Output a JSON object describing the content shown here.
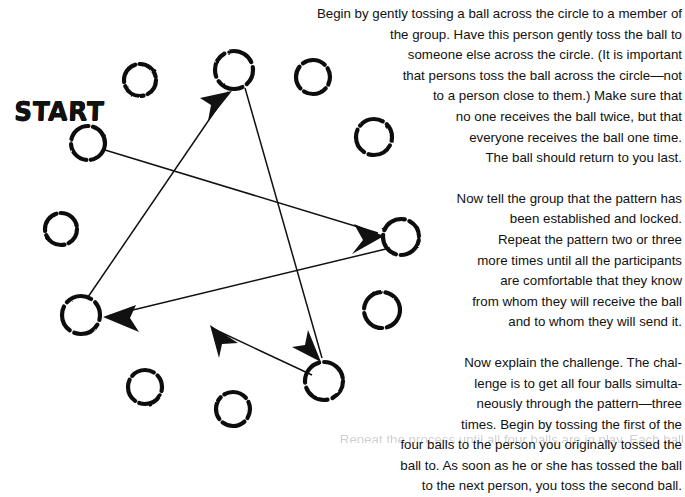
{
  "page": {
    "kind": "scanned-book-illustration",
    "background": "#ffffff",
    "ink_color": "#111111",
    "width": 685,
    "height": 444
  },
  "diagram": {
    "label": "START",
    "circle_count": 12,
    "circles": [
      {
        "id": "c-start",
        "name": "circle-start",
        "cx": 88,
        "cy": 143,
        "r": 17
      },
      {
        "id": "c-upper-left",
        "name": "circle-upper-left",
        "cx": 140,
        "cy": 80,
        "r": 16
      },
      {
        "id": "c-top",
        "name": "circle-top",
        "cx": 234,
        "cy": 70,
        "r": 19
      },
      {
        "id": "c-top-right",
        "name": "circle-top-right",
        "cx": 313,
        "cy": 77,
        "r": 17
      },
      {
        "id": "c-right-upper",
        "name": "circle-right-upper",
        "cx": 374,
        "cy": 137,
        "r": 18
      },
      {
        "id": "c-right-mid",
        "name": "circle-right-middle",
        "cx": 401,
        "cy": 237,
        "r": 18
      },
      {
        "id": "c-right-lower",
        "name": "circle-right-lower",
        "cx": 382,
        "cy": 310,
        "r": 18
      },
      {
        "id": "c-bottom-right",
        "name": "circle-bottom-right",
        "cx": 324,
        "cy": 381,
        "r": 19
      },
      {
        "id": "c-bottom-mid",
        "name": "circle-bottom-middle",
        "cx": 233,
        "cy": 409,
        "r": 17
      },
      {
        "id": "c-bottom-left",
        "name": "circle-bottom-left",
        "cx": 145,
        "cy": 387,
        "r": 17
      },
      {
        "id": "c-left-lower",
        "name": "circle-left-lower",
        "cx": 81,
        "cy": 315,
        "r": 19
      },
      {
        "id": "c-left-upper",
        "name": "circle-left-upper",
        "cx": 61,
        "cy": 229,
        "r": 16
      }
    ],
    "arrows": [
      {
        "name": "arrow-start-to-right-middle",
        "from": "c-start",
        "to": "c-right-mid"
      },
      {
        "name": "arrow-right-middle-to-left-lower",
        "from": "c-right-mid",
        "to": "c-left-lower"
      },
      {
        "name": "arrow-left-lower-to-top",
        "from": "c-left-lower",
        "to": "c-top"
      },
      {
        "name": "arrow-top-to-bottom-right",
        "from": "c-top",
        "to": "c-bottom-right"
      },
      {
        "name": "arrow-bottom-right-to-bottom-middle",
        "from": "c-bottom-right",
        "to": "c-bottom-mid"
      }
    ]
  },
  "text": {
    "paragraphs": [
      {
        "name": "paragraph-1",
        "lines": [
          "Begin by gently tossing a ball across the circle to a member of",
          "the group. Have this person gently toss the ball to",
          "someone else across the circle. (It is important",
          "that persons toss the ball across the circle—not",
          "to a person close to them.) Make sure that",
          "no one receives the ball twice, but that",
          "everyone receives the ball one time.",
          "The ball should return to you last."
        ]
      },
      {
        "name": "paragraph-2",
        "lines": [
          "Now tell the group that the pattern has",
          "been established and locked.",
          "Repeat the pattern two or three",
          "more times until all the participants",
          "are comfortable that they know",
          "from whom they will receive the ball",
          "and to whom they will send it."
        ]
      },
      {
        "name": "paragraph-3",
        "lines": [
          "Now explain the challenge. The chal-",
          "lenge is to get all four balls simulta-",
          "neously through the pattern—three",
          "times. Begin by tossing the first of the",
          "four balls to the person you originally tossed the",
          "ball to. As soon as he or she has tossed the ball",
          "to the next person, you toss the second ball."
        ]
      }
    ],
    "cut_off_line": "Repeat the process until all four balls are in play. Each ball"
  }
}
